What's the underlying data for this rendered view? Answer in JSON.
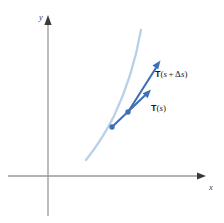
{
  "figure": {
    "name": "unit-tangent-vector-diagram",
    "width": 224,
    "height": 223,
    "background": "#ffffff"
  },
  "axes": {
    "x_label": "x",
    "y_label": "y",
    "color": "#9a9a9a",
    "origin": {
      "x": 48,
      "y": 176
    },
    "x_axis": {
      "x1": 8,
      "y1": 176,
      "x2": 206,
      "y2": 176,
      "arrow": "right"
    },
    "y_axis": {
      "x1": 48,
      "y1": 215,
      "x2": 48,
      "y2": 18,
      "arrow": "up"
    }
  },
  "curve": {
    "name": "space-curve",
    "color": "#b9d0ea",
    "stroke_width": 2.2,
    "path": "M 88,158 C 96,146 106,132 116,112 C 126,92 136,62 141,32",
    "description": "light blue upward-curving arc"
  },
  "points": [
    {
      "name": "point-s",
      "x": 112,
      "y": 127,
      "color": "#3f6fb5",
      "radius": 2.6
    },
    {
      "name": "point-s-plus-ds",
      "x": 128,
      "y": 112,
      "color": "#3f6fb5",
      "radius": 2.6
    }
  ],
  "vectors": [
    {
      "name": "tangent-vector-s-plus-ds",
      "color": "#3f6fb5",
      "stroke_width": 2.0,
      "from": {
        "x": 128,
        "y": 112
      },
      "to": {
        "x": 160,
        "y": 62
      },
      "label": {
        "bold": "T",
        "open": "(",
        "var": "s",
        "operator": "+",
        "delta": "Δ",
        "var2": "s",
        "close": ")",
        "plain": "T(s + Δs)"
      }
    },
    {
      "name": "tangent-vector-s",
      "color": "#3f6fb5",
      "stroke_width": 2.0,
      "from": {
        "x": 112,
        "y": 127
      },
      "to": {
        "x": 150,
        "y": 90
      },
      "label": {
        "bold": "T",
        "open": "(",
        "var": "s",
        "close": ")",
        "plain": "T(s)"
      }
    }
  ]
}
